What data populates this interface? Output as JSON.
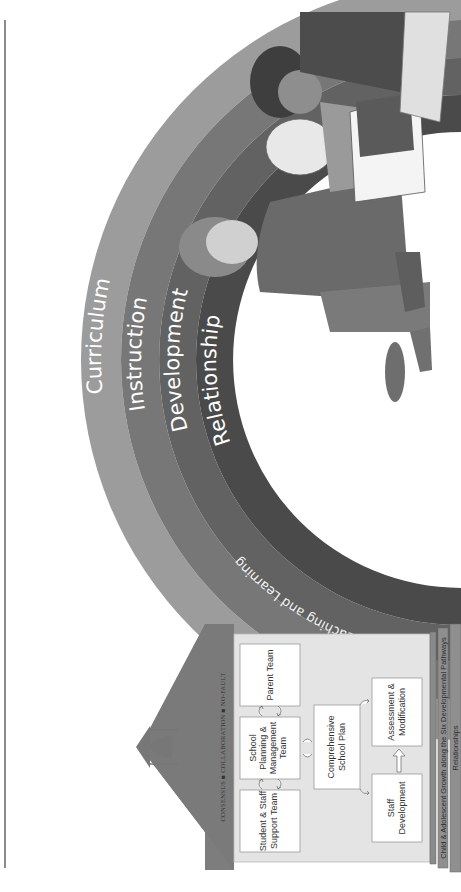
{
  "figure": {
    "orientation": "rotated-90-ccw",
    "colors": {
      "curriculum_band": "#9c9c9c",
      "instruction_band": "#777777",
      "development_band": "#626262",
      "relationship_band": "#4a4a4a",
      "roof": "#7d7d7d",
      "house_wall": "#e4e4e4",
      "box_fill": "#ffffff",
      "foundation": "#8f8f8f"
    }
  },
  "rainbow": {
    "bands": [
      {
        "label": "Curriculum"
      },
      {
        "label": "Instruction"
      },
      {
        "label": "Development"
      },
      {
        "label": "Relationship"
      }
    ],
    "inner_label": "Teaching and Learning"
  },
  "school": {
    "roof_text": "CONSENSUS ■ COLLABORATION ■ NO-FAULT",
    "teams": [
      {
        "line1": "Student & Staff",
        "line2": "Support Team",
        "line3": ""
      },
      {
        "line1": "School",
        "line2": "Planning &",
        "line3": "Management",
        "line4": "Team"
      },
      {
        "line1": "Parent Team",
        "line2": "",
        "line3": ""
      }
    ],
    "plan": {
      "line1": "Comprehensive",
      "line2": "School Plan"
    },
    "staff_development": {
      "line1": "Staff",
      "line2": "Development"
    },
    "assessment": {
      "line1": "Assessment &",
      "line2": "Modification"
    }
  },
  "foundation": {
    "growth": "Child & Adolescent Growth along the Six Developmental Pathways",
    "relationships": "Relationships"
  },
  "illustration": {
    "subject": "three-children-reading-book"
  }
}
